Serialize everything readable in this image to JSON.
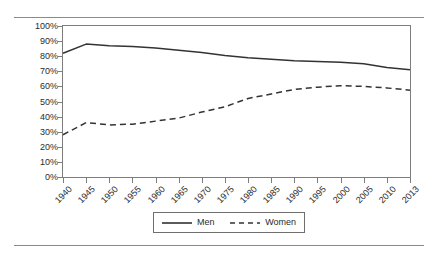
{
  "figure": {
    "has_top_rule": true,
    "has_bottom_rule": true,
    "rule_color": "#8a8a8a",
    "background": "#ffffff"
  },
  "chart_data": {
    "type": "line",
    "title": "",
    "subtitle": "",
    "xlabel": "",
    "ylabel": "",
    "x": [
      "1940",
      "1945",
      "1950",
      "1955",
      "1960",
      "1965",
      "1970",
      "1975",
      "1980",
      "1985",
      "1990",
      "1995",
      "2000",
      "2005",
      "2010",
      "2013"
    ],
    "categories": [
      "1940",
      "1945",
      "1950",
      "1955",
      "1960",
      "1965",
      "1970",
      "1975",
      "1980",
      "1985",
      "1990",
      "1995",
      "2000",
      "2005",
      "2010",
      "2013"
    ],
    "ylim": [
      0,
      100
    ],
    "yticks": [
      0,
      10,
      20,
      30,
      40,
      50,
      60,
      70,
      80,
      90,
      100
    ],
    "ytick_labels": [
      "0%",
      "10%",
      "20%",
      "30%",
      "40%",
      "50%",
      "60%",
      "70%",
      "80%",
      "90%",
      "100%"
    ],
    "ytick_suffix": "%",
    "grid": false,
    "legend_position": "bottom",
    "series": [
      {
        "name": "Men",
        "style": "solid",
        "color": "#333333",
        "values": [
          82,
          88,
          87,
          86.5,
          85.5,
          84,
          82.5,
          80.5,
          79,
          78,
          77,
          76.5,
          76,
          75,
          72.5,
          71
        ]
      },
      {
        "name": "Women",
        "style": "dashed",
        "color": "#333333",
        "values": [
          28,
          36,
          34.5,
          35,
          37,
          39,
          43,
          46.5,
          52,
          55,
          58,
          59.5,
          60.5,
          60,
          59,
          57.5
        ]
      }
    ],
    "legend": [
      "Men",
      "Women"
    ]
  }
}
